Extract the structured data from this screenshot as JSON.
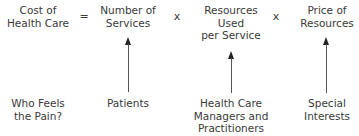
{
  "equation": {
    "lhs": [
      "Cost of",
      "Health Care"
    ],
    "equals": "=",
    "terms": [
      [
        "Number of",
        "Services"
      ],
      [
        "Resources",
        "Used",
        "per Service"
      ],
      [
        "Price of",
        "Resources"
      ]
    ],
    "operators": [
      "x",
      "x"
    ]
  },
  "row_label": [
    "Who Feels",
    "the Pain?"
  ],
  "bearers": [
    [
      "Patients"
    ],
    [
      "Health Care",
      "Managers and",
      "Practitioners"
    ],
    [
      "Special",
      "Interests"
    ]
  ]
}
